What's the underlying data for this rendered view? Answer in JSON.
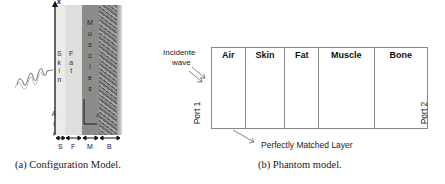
{
  "figure_a": {
    "caption": "(a) Configuration Model.",
    "axis_label_top": "x",
    "axis_label_corner": "z",
    "air_label": "A i r",
    "layers": [
      {
        "key": "skin",
        "vertical_text": [
          "S",
          "k",
          "i",
          "n"
        ],
        "bottom_label": "S",
        "color": "#e8e8e6"
      },
      {
        "key": "fat",
        "vertical_text": [
          "F",
          "a",
          "t"
        ],
        "bottom_label": "F",
        "color": "#dcdcda"
      },
      {
        "key": "muscle",
        "vertical_text": [
          "M",
          "u",
          "s",
          "c",
          "l",
          "e",
          "s"
        ],
        "bottom_label": "M",
        "color": "#8a8a88"
      },
      {
        "key": "bone",
        "vertical_text": [],
        "bottom_label": "B",
        "color": "#6f6f6d"
      }
    ]
  },
  "figure_b": {
    "caption": "(b) Phantom model.",
    "incident_label_line1": "Incidente",
    "incident_label_line2": "wave",
    "port1": "Port 1",
    "port2": "Port 2",
    "pml_label": "Perfectly Matched Layer",
    "regions": [
      {
        "label": "Air",
        "width": 34
      },
      {
        "label": "Skin",
        "width": 40
      },
      {
        "label": "Fat",
        "width": 34
      },
      {
        "label": "Muscle",
        "width": 56
      },
      {
        "label": "Bone",
        "width": 53
      }
    ]
  }
}
